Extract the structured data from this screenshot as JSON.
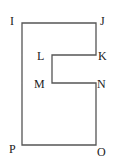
{
  "diagram": {
    "type": "polygon-outline",
    "stroke_color": "#555555",
    "vertices": [
      {
        "name": "I",
        "x": 22,
        "y": 23
      },
      {
        "name": "J",
        "x": 96,
        "y": 23
      },
      {
        "name": "K",
        "x": 96,
        "y": 55
      },
      {
        "name": "L",
        "x": 52,
        "y": 55
      },
      {
        "name": "M",
        "x": 52,
        "y": 83
      },
      {
        "name": "N",
        "x": 96,
        "y": 83
      },
      {
        "name": "O",
        "x": 96,
        "y": 145
      },
      {
        "name": "P",
        "x": 22,
        "y": 145
      }
    ],
    "labels": {
      "I": "I",
      "J": "J",
      "K": "K",
      "L": "L",
      "M": "M",
      "N": "N",
      "O": "O",
      "P": "P"
    }
  }
}
